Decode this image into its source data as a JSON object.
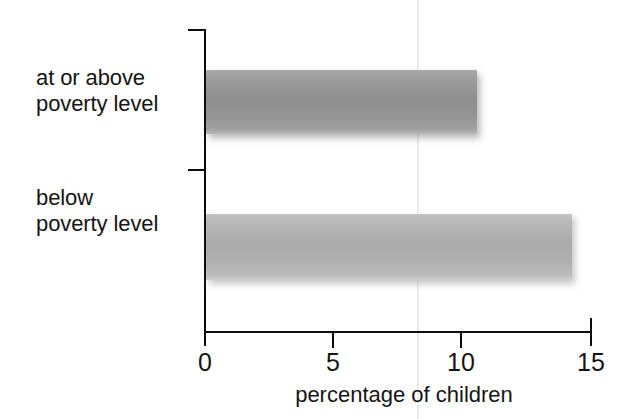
{
  "chart_data": {
    "type": "bar",
    "orientation": "horizontal",
    "title": "",
    "subtitle": "",
    "xlabel": "percentage of children",
    "ylabel": "",
    "categories": [
      "at or above\npoverty level",
      "below\npoverty level"
    ],
    "values": [
      10.6,
      14.3
    ],
    "xlim": [
      0,
      15
    ],
    "xticks": [
      0,
      5,
      10,
      15
    ],
    "xtick_labels": [
      "0",
      "5",
      "10",
      "15"
    ],
    "grid": false,
    "legend": false,
    "legend_position": "none",
    "series": [
      {
        "name": "percentage of children",
        "values": [
          10.6,
          14.3
        ]
      }
    ],
    "bar_colors": [
      "#9a9a9a",
      "#b4b4b4"
    ],
    "annotations": []
  },
  "axis": {
    "x_title": "percentage of children",
    "tick_labels": [
      "0",
      "5",
      "10",
      "15"
    ]
  },
  "categories": [
    {
      "label": "at or above\npoverty level",
      "value": 10.6
    },
    {
      "label": "below\npoverty level",
      "value": 14.3
    }
  ],
  "colors": {
    "axis": "#0d0d0d",
    "text": "#151515",
    "background": "#ffffff",
    "bar_above_poverty": "#9a9a9a",
    "bar_below_poverty": "#b4b4b4"
  }
}
